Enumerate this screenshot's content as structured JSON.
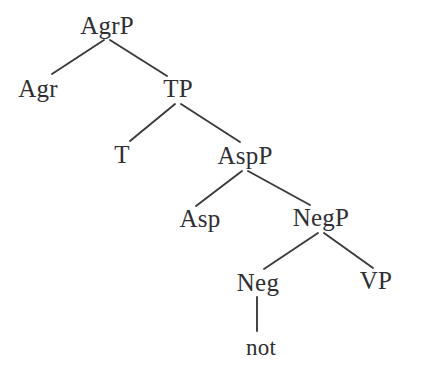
{
  "figure": {
    "kind": "syntactic-tree-diagram",
    "background_color": "#ffffff",
    "line_color": "#3a3a3c",
    "text_color": "#2f2f33",
    "width": 423,
    "height": 379
  },
  "tree": {
    "nodes": [
      {
        "id": "agrp",
        "label": "AgrP",
        "x": 107,
        "y": 34,
        "type": "phrase",
        "level": 0
      },
      {
        "id": "agr",
        "label": "Agr",
        "x": 38,
        "y": 97,
        "type": "head",
        "level": 1
      },
      {
        "id": "tp",
        "label": "TP",
        "x": 178,
        "y": 97,
        "type": "phrase",
        "level": 1
      },
      {
        "id": "t",
        "label": "T",
        "x": 122,
        "y": 163,
        "type": "head",
        "level": 2
      },
      {
        "id": "aspp",
        "label": "AspP",
        "x": 245,
        "y": 164,
        "type": "phrase",
        "level": 2
      },
      {
        "id": "asp",
        "label": "Asp",
        "x": 200,
        "y": 227,
        "type": "head",
        "level": 3
      },
      {
        "id": "negp",
        "label": "NegP",
        "x": 321,
        "y": 226,
        "type": "phrase",
        "level": 3
      },
      {
        "id": "neg",
        "label": "Neg",
        "x": 258,
        "y": 291,
        "type": "head",
        "level": 4
      },
      {
        "id": "vp",
        "label": "VP",
        "x": 376,
        "y": 289,
        "type": "phrase",
        "level": 4
      },
      {
        "id": "not",
        "label": "not",
        "x": 261,
        "y": 355,
        "type": "terminal",
        "level": 5
      }
    ],
    "edges": [
      {
        "id": "agrp-agr",
        "from": "agrp",
        "to": "agr",
        "x1": 104,
        "y1": 40,
        "x2": 52,
        "y2": 74
      },
      {
        "id": "agrp-tp",
        "from": "agrp",
        "to": "tp",
        "x1": 110,
        "y1": 40,
        "x2": 167,
        "y2": 76
      },
      {
        "id": "tp-t",
        "from": "tp",
        "to": "t",
        "x1": 175,
        "y1": 104,
        "x2": 130,
        "y2": 141
      },
      {
        "id": "tp-aspp",
        "from": "tp",
        "to": "aspp",
        "x1": 181,
        "y1": 104,
        "x2": 240,
        "y2": 142
      },
      {
        "id": "aspp-asp",
        "from": "aspp",
        "to": "asp",
        "x1": 242,
        "y1": 171,
        "x2": 196,
        "y2": 206
      },
      {
        "id": "aspp-negp",
        "from": "aspp",
        "to": "negp",
        "x1": 248,
        "y1": 171,
        "x2": 310,
        "y2": 205
      },
      {
        "id": "negp-neg",
        "from": "negp",
        "to": "neg",
        "x1": 318,
        "y1": 233,
        "x2": 264,
        "y2": 269
      },
      {
        "id": "negp-vp",
        "from": "negp",
        "to": "vp",
        "x1": 324,
        "y1": 233,
        "x2": 373,
        "y2": 268
      },
      {
        "id": "neg-not",
        "from": "neg",
        "to": "not",
        "x1": 257,
        "y1": 297,
        "x2": 257,
        "y2": 331
      }
    ]
  },
  "labels": {
    "agrp": "AgrP",
    "agr": "Agr",
    "tp": "TP",
    "t": "T",
    "aspp": "AspP",
    "asp": "Asp",
    "negp": "NegP",
    "neg": "Neg",
    "vp": "VP",
    "not": "not"
  }
}
